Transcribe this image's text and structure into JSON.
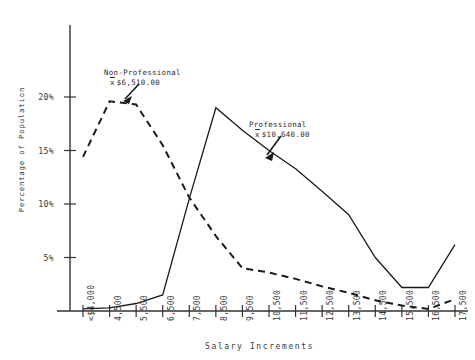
{
  "chart_data": {
    "type": "line",
    "title": "",
    "xlabel": "Salary  Increments",
    "ylabel": "Percentage of Population",
    "categories": [
      "<$4,000",
      "4,500",
      "5,500",
      "6,500",
      "7,500",
      "8,500",
      "9,500",
      "10,500",
      "11,500",
      "12,500",
      "13,500",
      "14,500",
      "15,500",
      "16,500",
      "17,500"
    ],
    "ytick_labels": [
      "5%",
      "10%",
      "15%",
      "20%"
    ],
    "ytick_values": [
      5,
      10,
      15,
      20
    ],
    "ylim": [
      0,
      23
    ],
    "grid": false,
    "legend_position": "annotations-inline",
    "series": [
      {
        "name": "Non-Professional",
        "style": "dashed",
        "mean_label": "$6,510.00",
        "values": [
          14.4,
          19.6,
          19.3,
          15.5,
          10.6,
          7.0,
          4.0,
          3.6,
          3.0,
          2.3,
          1.7,
          1.0,
          0.5,
          0.2,
          1.1
        ]
      },
      {
        "name": "Professional",
        "style": "solid",
        "mean_label": "$10,640.00",
        "values": [
          0.2,
          0.3,
          0.7,
          1.5,
          10.5,
          19.0,
          16.9,
          15.0,
          13.3,
          11.2,
          9.0,
          5.0,
          2.2,
          2.2,
          6.2
        ]
      }
    ],
    "annotations": [
      {
        "name": "Non-Professional",
        "mean_symbol": "x",
        "mean_value": "$6,510.00",
        "points_to_category": "4,500"
      },
      {
        "name": "Professional",
        "mean_symbol": "x",
        "mean_value": "$10,640.00",
        "points_to_category": "10,500"
      }
    ]
  },
  "axis": {
    "y_title": "Percentage of Population",
    "x_title": "Salary  Increments"
  }
}
